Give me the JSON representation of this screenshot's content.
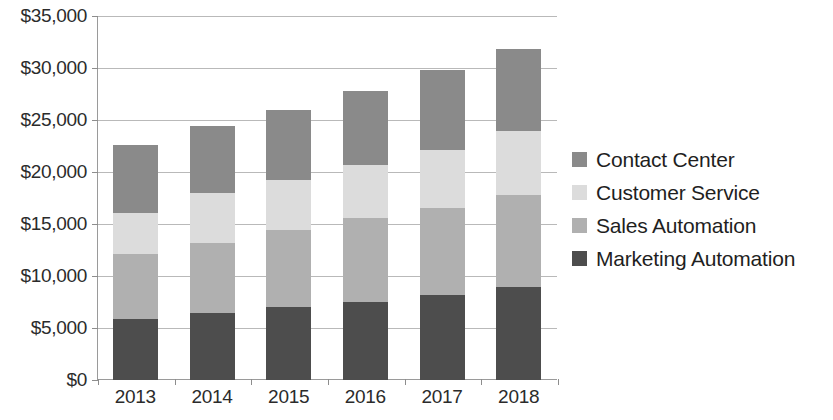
{
  "chart_data": {
    "type": "bar",
    "subtype": "stacked-bar",
    "title": "",
    "xlabel": "",
    "ylabel": "",
    "categories": [
      "2013",
      "2014",
      "2015",
      "2016",
      "2017",
      "2018"
    ],
    "series": [
      {
        "name": "Marketing Automation",
        "color": "#4d4d4d",
        "values": [
          5900,
          6400,
          7050,
          7500,
          8200,
          8900
        ]
      },
      {
        "name": "Sales Automation",
        "color": "#b0b0b0",
        "values": [
          6250,
          6800,
          7350,
          8050,
          8350,
          8900
        ]
      },
      {
        "name": "Customer Service",
        "color": "#dcdcdc",
        "values": [
          3950,
          4800,
          4800,
          5100,
          5550,
          6100
        ]
      },
      {
        "name": "Contact Center",
        "color": "#8a8a8a",
        "values": [
          6500,
          6450,
          6800,
          7150,
          7700,
          7900
        ]
      }
    ],
    "totals": [
      22600,
      24450,
      26000,
      27800,
      29800,
      31800
    ],
    "ylim": [
      0,
      35000
    ],
    "ytick_values": [
      0,
      5000,
      10000,
      15000,
      20000,
      25000,
      30000,
      35000
    ],
    "ytick_labels": [
      "$0",
      "$5,000",
      "$10,000",
      "$15,000",
      "$20,000",
      "$25,000",
      "$30,000",
      "$35,000"
    ],
    "grid": true,
    "grid_axis": "y",
    "legend_position": "right",
    "legend_order": [
      "Contact Center",
      "Customer Service",
      "Sales Automation",
      "Marketing Automation"
    ],
    "currency": "USD",
    "background_color": "#ffffff",
    "axis_color": "#9a9a9a",
    "gridline_color": "#b9b9b9",
    "text_color": "#2b2b2b"
  },
  "legend": {
    "items": [
      {
        "label": "Contact Center",
        "color": "#8a8a8a"
      },
      {
        "label": "Customer Service",
        "color": "#dcdcdc"
      },
      {
        "label": "Sales Automation",
        "color": "#b0b0b0"
      },
      {
        "label": "Marketing Automation",
        "color": "#4d4d4d"
      }
    ]
  }
}
